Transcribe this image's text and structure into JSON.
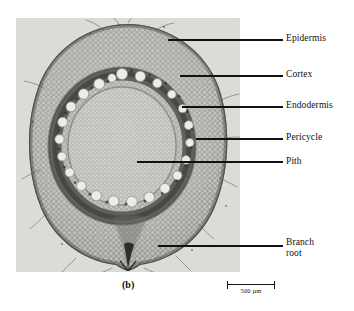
{
  "figure": {
    "caption": "(b)",
    "panel_background": "#d9dad6"
  },
  "labels": [
    {
      "id": "epidermis",
      "text": "Epidermis",
      "target": "outer cell layer of root"
    },
    {
      "id": "cortex",
      "text": "Cortex",
      "target": "parenchyma between epidermis and stele"
    },
    {
      "id": "endodermis",
      "text": "Endodermis",
      "target": "dark ring bounding the stele"
    },
    {
      "id": "pericycle",
      "text": "Pericycle",
      "target": "layer just inside endodermis"
    },
    {
      "id": "pith",
      "text": "Pith",
      "target": "central parenchyma core"
    },
    {
      "id": "branchroot",
      "text": "Branch\nroot",
      "target": "lateral root emerging at lower margin"
    }
  ],
  "scale_bar": {
    "value": "500",
    "unit": "µm",
    "text": "500 µm",
    "length_px": 48
  },
  "structure": {
    "root_outline_note": "roughly circular root section filling most of the panel",
    "vessel_count": 23,
    "vessel_fill": "#e9e9e5",
    "endodermis_ring_color": "#4b4b4b",
    "cortex_color": "#a9aaa6",
    "pith_color": "#b6b7b3",
    "epidermis_rim_color": "#6e6f6b",
    "line_color": "#111111"
  }
}
